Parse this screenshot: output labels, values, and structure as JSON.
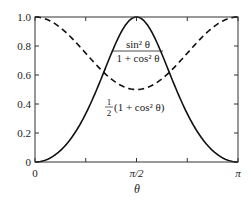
{
  "chart_data": {
    "type": "line",
    "title": "",
    "xlabel": "θ",
    "ylabel": "",
    "xlim": [
      0,
      3.14159
    ],
    "ylim": [
      0,
      1.0
    ],
    "grid": false,
    "legend": null,
    "x_ticks": [
      0,
      0.7854,
      1.5708,
      2.3562,
      3.14159
    ],
    "x_tick_labels": [
      "0",
      "",
      "π/2",
      "",
      "π"
    ],
    "y_ticks": [
      0,
      0.2,
      0.4,
      0.6,
      0.8,
      1.0
    ],
    "y_tick_labels": [
      "0",
      "0.2",
      "0.4",
      "0.6",
      "0.8",
      "1.0"
    ],
    "series": [
      {
        "name": "sin²θ / (1 + cos²θ)",
        "style": "solid",
        "color": "#111111",
        "formula": "sin(t)^2/(1+cos(t)^2)",
        "x": [
          0,
          0.3927,
          0.7854,
          1.1781,
          1.5708,
          1.9635,
          2.3562,
          2.7489,
          3.14159
        ],
        "y": [
          0,
          0.079,
          0.333,
          0.745,
          1.0,
          0.745,
          0.333,
          0.079,
          0
        ]
      },
      {
        "name": "½(1 + cos²θ)",
        "style": "dashed",
        "color": "#111111",
        "formula": "0.5*(1+cos(t)^2)",
        "x": [
          0,
          0.3927,
          0.7854,
          1.1781,
          1.5708,
          1.9635,
          2.3562,
          2.7489,
          3.14159
        ],
        "y": [
          1.0,
          0.927,
          0.75,
          0.573,
          0.5,
          0.573,
          0.75,
          0.927,
          1.0
        ]
      }
    ],
    "annotations": [
      {
        "text_num": "sin² θ",
        "text_den": "1 + cos² θ",
        "x": 1.7,
        "y": 0.8,
        "target": "sin²θ / (1 + cos²θ)"
      },
      {
        "text_prefix_num": "1",
        "text_prefix_den": "2",
        "text": "(1 + cos² θ)",
        "x": 1.7,
        "y": 0.38,
        "target": "½(1 + cos²θ)"
      }
    ]
  },
  "labels": {
    "x_axis": "θ",
    "anno1_num": "sin² θ",
    "anno1_den": "1 + cos² θ",
    "anno2_half_num": "1",
    "anno2_half_den": "2",
    "anno2_rest": "(1 + cos² θ)"
  }
}
